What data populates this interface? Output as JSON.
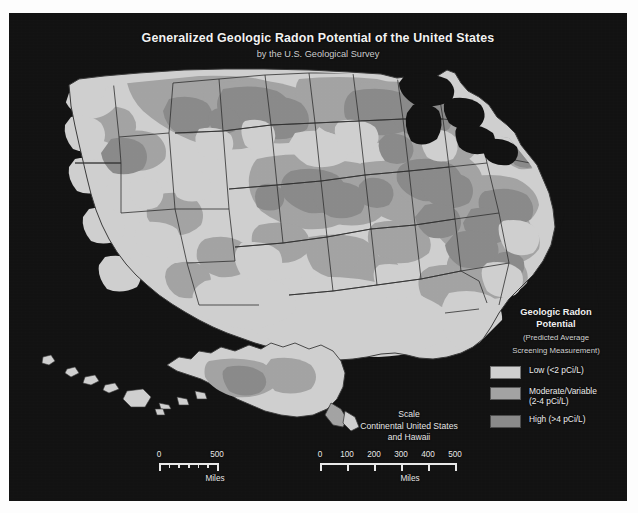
{
  "figure": {
    "title": "Generalized Geologic Radon Potential of the United States",
    "subtitle": "by the U.S. Geological Survey"
  },
  "legend": {
    "title_line1": "Geologic Radon",
    "title_line2": "Potential",
    "subtitle_line1": "(Predicted Average",
    "subtitle_line2": "Screening Measurement)",
    "items": [
      {
        "label_line1": "Low (<2 pCi/L)",
        "label_line2": "",
        "color": "#cfcfcf",
        "class": "low"
      },
      {
        "label_line1": "Moderate/Variable",
        "label_line2": "(2-4 pCi/L)",
        "color": "#a3a3a3",
        "class": "moderate"
      },
      {
        "label_line1": "High (>4 pCi/L)",
        "label_line2": "",
        "color": "#8a8a8a",
        "class": "high"
      }
    ]
  },
  "scale_caption": {
    "line1": "Scale",
    "line2": "Continental United States",
    "line3": "and Hawaii"
  },
  "scale_alaska": {
    "labels": [
      "0",
      "500"
    ],
    "label_positions": [
      0,
      58
    ],
    "tick_positions": [
      0,
      9.7,
      19.4,
      29,
      38.7,
      48.4,
      58
    ],
    "bar_width": 58,
    "unit": "Miles"
  },
  "scale_continental": {
    "labels": [
      "0",
      "100",
      "200",
      "300",
      "400",
      "500"
    ],
    "label_positions": [
      0,
      27,
      54,
      81,
      108,
      135
    ],
    "tick_positions": [
      0,
      27,
      54,
      81,
      108,
      135
    ],
    "bar_width": 135,
    "unit": "Miles"
  },
  "colors": {
    "background": "#121212",
    "page": "#fdfdfd",
    "low": "#cfcfcf",
    "moderate": "#a3a3a3",
    "high": "#8a8a8a",
    "border": "#2a2a2a",
    "text": "#f0f0f0"
  },
  "chart_data": {
    "type": "map",
    "title": "Generalized Geologic Radon Potential of the United States",
    "subtitle": "by the U.S. Geological Survey",
    "projection": "continental United States with Alaska and Hawaii insets",
    "categories": [
      "Low (<2 pCi/L)",
      "Moderate/Variable (2-4 pCi/L)",
      "High (>4 pCi/L)"
    ],
    "category_colors": [
      "#cfcfcf",
      "#a3a3a3",
      "#8a8a8a"
    ],
    "units": "pCi/L",
    "measure": "Predicted Average Screening Measurement",
    "legend_position": "bottom-right",
    "scalebar_units": "Miles",
    "scalebar_max_continental": 500,
    "scalebar_max_alaska": 500
  }
}
